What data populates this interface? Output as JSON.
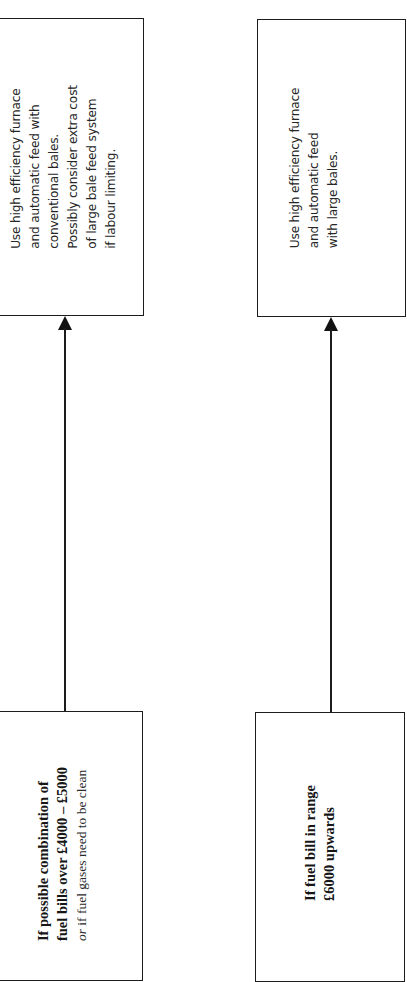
{
  "diagram": {
    "orientation": "rotated-90-ccw",
    "colors": {
      "line": "#1c1c1c",
      "background": "#ffffff",
      "text": "#1a1a1a"
    },
    "branches": [
      {
        "condition": {
          "lines": [
            "If possible combination of",
            "fuel bills over £4000 – £5000"
          ],
          "alt_prefix": "or",
          "alt_text": " if fuel gases need to be clean"
        },
        "recommendation": {
          "lines": [
            "Use high efficiency furnace",
            "and automatic feed with",
            "conventional bales.",
            "Possibly consider extra cost",
            "of large bale feed system",
            "if labour limiting."
          ]
        }
      },
      {
        "condition": {
          "lines": [
            "If fuel bill in range",
            "£6000 upwards"
          ]
        },
        "recommendation": {
          "lines": [
            "Use high efficiency furnace",
            "and automatic feed",
            "with large bales."
          ]
        }
      }
    ]
  }
}
